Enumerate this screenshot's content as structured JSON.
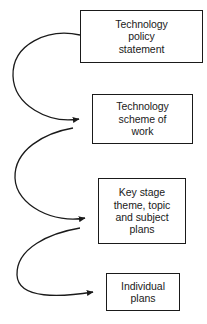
{
  "diagram": {
    "type": "flow",
    "orientation": "vertical-cascade",
    "background_color": "#ffffff",
    "line_color": "#1a1a1a",
    "text_color": "#1a1a1a",
    "nodes": [
      {
        "id": "policy-statement",
        "label": "Technology\npolicy\nstatement",
        "lines": [
          "Technology",
          "policy",
          "statement"
        ]
      },
      {
        "id": "scheme-of-work",
        "label": "Technology\nscheme of\nwork",
        "lines": [
          "Technology",
          "scheme of",
          "work"
        ]
      },
      {
        "id": "stage-plans",
        "label": "Key stage\ntheme, topic\nand subject\nplans",
        "lines": [
          "Key stage",
          "theme, topic",
          "and subject",
          "plans"
        ]
      },
      {
        "id": "individual-plans",
        "label": "Individual\nplans",
        "lines": [
          "Individual",
          "plans"
        ]
      }
    ],
    "connectors": [
      {
        "id": "policy-to-scheme",
        "from": "policy-statement",
        "to": "scheme-of-work",
        "style": "curved-left-loop",
        "arrowhead": "filled-triangle"
      },
      {
        "id": "scheme-to-stage",
        "from": "scheme-of-work",
        "to": "stage-plans",
        "style": "curved-left-loop",
        "arrowhead": "filled-triangle"
      },
      {
        "id": "stage-to-individual",
        "from": "stage-plans",
        "to": "individual-plans",
        "style": "curved-left-loop",
        "arrowhead": "filled-triangle"
      }
    ]
  }
}
